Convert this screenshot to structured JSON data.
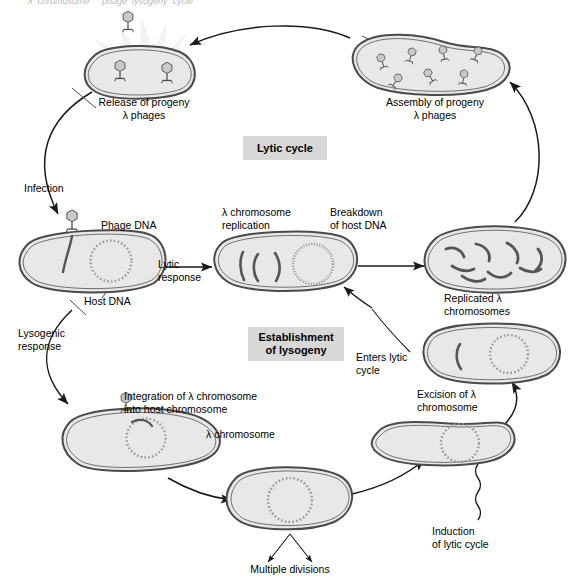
{
  "figure": {
    "title_clipped": "λ  chromosome     phage  lysogeny  cycle",
    "background_color": "#ffffff",
    "cell_fill_color": "#e8e8e8",
    "cell_stroke_color": "#4a4a4a",
    "dna_color": "#555555",
    "phase_box_color": "#d8d8d8",
    "text_color": "#000000"
  },
  "phase_boxes": [
    {
      "id": "lytic-cycle-box",
      "label": "Lytic cycle"
    },
    {
      "id": "establishment-of-lysogeny-box",
      "label": "Establishment\nof lysogeny"
    }
  ],
  "labels": {
    "release_of_progeny": "Release of progeny\nλ phages",
    "assembly_of_progeny": "Assembly of progeny\nλ phages",
    "infection": "Infection",
    "phage_dna": "Phage DNA",
    "host_dna": "Host DNA",
    "lytic_response": "Lytic\nresponse",
    "lysogenic_response": "Lysogenic\nresponse",
    "lambda_chromosome_replication": "λ chromosome\nreplication",
    "breakdown_of_host_dna": "Breakdown\nof host DNA",
    "replicated_lambda_chromosomes": "Replicated λ\nchromosomes",
    "enters_lytic_cycle": "Enters lytic\ncycle",
    "integration_of_lambda": "Integration of λ chromosome\ninto host chromosome",
    "lambda_chromosome": "λ chromosome",
    "excision_of_lambda": "Excision of λ\nchromosome",
    "induction_of_lytic_cycle": "Induction\nof lytic cycle",
    "multiple_divisions": "Multiple divisions"
  },
  "cells": [
    {
      "id": "cell-release",
      "stage": "Release of progeny λ phages",
      "phage_count": 3,
      "burst": true
    },
    {
      "id": "cell-assembly",
      "stage": "Assembly of progeny λ phages",
      "phage_count": 7
    },
    {
      "id": "cell-infected",
      "stage": "Infected host cell",
      "has_phage_attached": true,
      "has_host_dna_circle": true,
      "has_phage_dna": true
    },
    {
      "id": "cell-replication",
      "stage": "λ chromosome replication / breakdown of host DNA",
      "lambda_fragments": 3,
      "degrading_host_dna": true
    },
    {
      "id": "cell-replicated",
      "stage": "Replicated λ chromosomes",
      "lambda_fragments": 8
    },
    {
      "id": "cell-enters-lytic",
      "stage": "Enters lytic cycle",
      "lambda_fragments": 1,
      "has_host_dna_circle": true
    },
    {
      "id": "cell-excision",
      "stage": "Excision of λ chromosome",
      "has_host_dna_circle": true
    },
    {
      "id": "cell-integration",
      "stage": "Integration of λ chromosome into host chromosome",
      "has_phage_attached": true,
      "has_host_dna_circle": true
    },
    {
      "id": "cell-divisions",
      "stage": "Multiple divisions (prophage carried)",
      "has_host_dna_circle": true
    }
  ],
  "arrows": [
    {
      "id": "arrow-assembly-to-release",
      "from": "cell-assembly",
      "to": "cell-release"
    },
    {
      "id": "arrow-release-to-infection",
      "from": "cell-release",
      "to": "cell-infected",
      "label": "Infection"
    },
    {
      "id": "arrow-lytic-response",
      "from": "cell-infected",
      "to": "cell-replication",
      "label": "Lytic\nresponse"
    },
    {
      "id": "arrow-replication-to-replicated",
      "from": "cell-replication",
      "to": "cell-replicated"
    },
    {
      "id": "arrow-replicated-to-assembly",
      "from": "cell-replicated",
      "to": "cell-assembly"
    },
    {
      "id": "arrow-lysogenic-response",
      "from": "cell-infected",
      "to": "cell-integration",
      "label": "Lysogenic\nresponse"
    },
    {
      "id": "arrow-integration-to-divisions",
      "from": "cell-integration",
      "to": "cell-divisions",
      "label": "Multiple divisions"
    },
    {
      "id": "arrow-divisions-to-excision",
      "from": "cell-divisions",
      "to": "cell-excision"
    },
    {
      "id": "arrow-induction",
      "from": "induction",
      "to": "cell-excision",
      "label": "Induction\nof lytic cycle",
      "style": "wavy"
    },
    {
      "id": "arrow-excision-to-enters-lytic",
      "from": "cell-excision",
      "to": "cell-enters-lytic",
      "label": "Excision of λ\nchromosome"
    },
    {
      "id": "arrow-enters-lytic",
      "from": "cell-enters-lytic",
      "to": "cell-replication",
      "label": "Enters lytic\ncycle"
    }
  ]
}
